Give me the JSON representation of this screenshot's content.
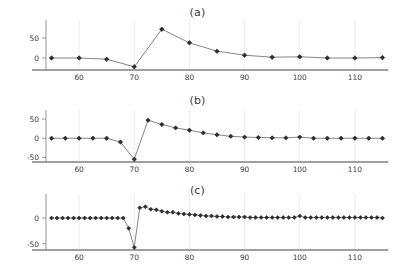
{
  "figure": {
    "width": 395,
    "height": 276,
    "background": "#ffffff",
    "line_color": "#6e6e6e",
    "marker_color": "#2b2b2b",
    "axis_color": "#808080",
    "grid_color": "#e8e8e8",
    "text_color": "#3d3d3d"
  },
  "panels": [
    {
      "id": "a",
      "title": "(a)"
    },
    {
      "id": "b",
      "title": "(b)"
    },
    {
      "id": "c",
      "title": "(c)"
    }
  ],
  "chart_data": [
    {
      "type": "line",
      "title": "(a)",
      "xlabel": "",
      "ylabel": "",
      "xlim": [
        54,
        116
      ],
      "ylim": [
        -30,
        80
      ],
      "xticks": [
        60,
        70,
        80,
        90,
        100,
        110
      ],
      "yticks": [
        0,
        50
      ],
      "grid": true,
      "legend": "none",
      "markers": "diamond",
      "x": [
        55,
        60,
        65,
        70,
        75,
        80,
        85,
        90,
        95,
        100,
        105,
        110,
        115
      ],
      "y": [
        0,
        0,
        -3,
        -22,
        72,
        38,
        17,
        7,
        2,
        3,
        0,
        0,
        1
      ]
    },
    {
      "type": "line",
      "title": "(b)",
      "xlabel": "",
      "ylabel": "",
      "xlim": [
        54,
        116
      ],
      "ylim": [
        -62,
        58
      ],
      "xticks": [
        60,
        70,
        80,
        90,
        100,
        110
      ],
      "yticks": [
        -50,
        0,
        50
      ],
      "grid": true,
      "legend": "none",
      "markers": "diamond",
      "x": [
        55,
        57.5,
        60,
        62.5,
        65,
        67.5,
        70,
        72.5,
        75,
        77.5,
        80,
        82.5,
        85,
        87.5,
        90,
        92.5,
        95,
        97.5,
        100,
        102.5,
        105,
        107.5,
        110,
        112.5,
        115
      ],
      "y": [
        0,
        0,
        0,
        0,
        0,
        -10,
        -55,
        47,
        36,
        27,
        21,
        14,
        9,
        5,
        3,
        2,
        1,
        1,
        3,
        0,
        0,
        0,
        0,
        0,
        0
      ]
    },
    {
      "type": "line",
      "title": "(c)",
      "xlabel": "",
      "ylabel": "",
      "xlim": [
        54,
        116
      ],
      "ylim": [
        -62,
        35
      ],
      "xticks": [
        60,
        70,
        80,
        90,
        100,
        110
      ],
      "yticks": [
        -50,
        0
      ],
      "grid": true,
      "legend": "none",
      "markers": "diamond",
      "x": [
        55,
        56,
        57,
        58,
        59,
        60,
        61,
        62,
        63,
        64,
        65,
        66,
        67,
        68,
        69,
        70,
        71,
        72,
        73,
        74,
        75,
        76,
        77,
        78,
        79,
        80,
        81,
        82,
        83,
        84,
        85,
        86,
        87,
        88,
        89,
        90,
        91,
        92,
        93,
        94,
        95,
        96,
        97,
        98,
        99,
        100,
        101,
        102,
        103,
        104,
        105,
        106,
        107,
        108,
        109,
        110,
        111,
        112,
        113,
        114,
        115
      ],
      "y": [
        0,
        0,
        0,
        0,
        0,
        0,
        0,
        0,
        0,
        0,
        0,
        0,
        0,
        0,
        -20,
        -57,
        20,
        22,
        17,
        16,
        13,
        11,
        11,
        9,
        8,
        7,
        6,
        5,
        4,
        4,
        3,
        3,
        2,
        2,
        2,
        2,
        1,
        1,
        1,
        1,
        1,
        1,
        1,
        1,
        1,
        4,
        1,
        1,
        1,
        1,
        1,
        1,
        1,
        1,
        1,
        1,
        1,
        1,
        1,
        1,
        0
      ]
    }
  ]
}
